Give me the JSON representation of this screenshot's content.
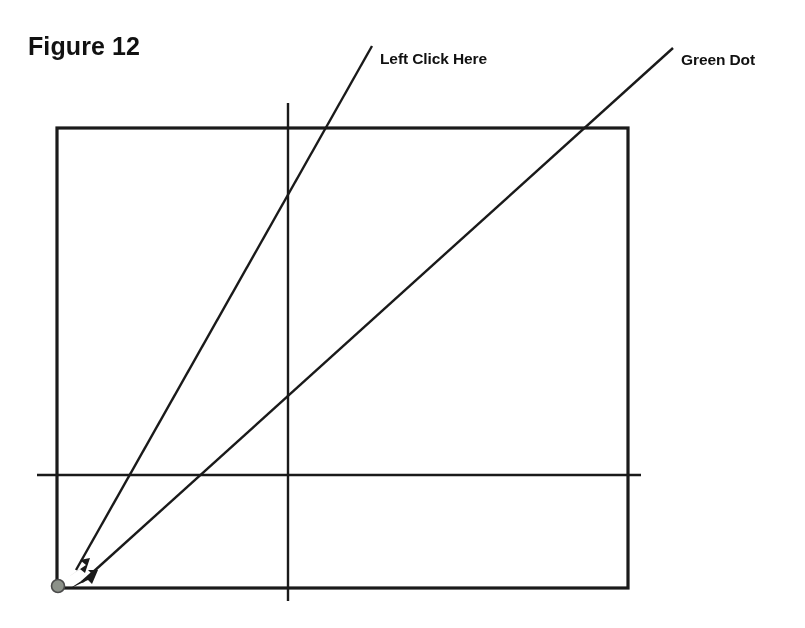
{
  "figure": {
    "title": "Figure 12",
    "background_color": "#ffffff",
    "ink_color": "#1a1a1a",
    "width": 805,
    "height": 628
  },
  "annotations": [
    {
      "id": "left-click-here",
      "text": "Left Click Here",
      "text_x": 380,
      "text_y": 50,
      "leader_from_x": 372,
      "leader_from_y": 46,
      "leader_to_x": 70,
      "leader_to_y": 574,
      "arrowhead": true
    },
    {
      "id": "green-dot",
      "text": "Green Dot",
      "text_x": 681,
      "text_y": 51,
      "leader_from_x": 673,
      "leader_from_y": 48,
      "leader_to_x": 74,
      "leader_to_y": 586,
      "arrowhead": true
    }
  ],
  "diagram": {
    "rectangle": {
      "name": "screen-area-rectangle",
      "x": 57,
      "y": 128,
      "width": 571,
      "height": 460,
      "stroke_width": 3.2,
      "stroke_color": "#1a1a1a"
    },
    "crosshair_vertical": {
      "name": "vertical-crosshair-line",
      "x": 288,
      "y_top": 103,
      "y_bottom": 601,
      "stroke_width": 2.4,
      "stroke_color": "#1a1a1a"
    },
    "crosshair_horizontal": {
      "name": "horizontal-crosshair-line",
      "y": 475,
      "x_left": 37,
      "x_right": 641,
      "stroke_width": 2.4,
      "stroke_color": "#1a1a1a"
    },
    "green_dot": {
      "name": "green-dot-marker",
      "cx": 58,
      "cy": 586,
      "r": 6.5,
      "fill_color": "#8c9188",
      "stroke_color": "#4a4a4a",
      "label": "Green Dot"
    }
  }
}
